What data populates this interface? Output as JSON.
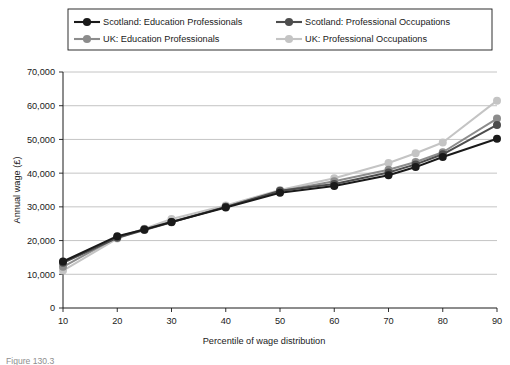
{
  "chart_data": {
    "type": "line",
    "title": "",
    "xlabel": "Percentile of wage distribution",
    "ylabel": "Annual wage (£)",
    "x": [
      10,
      20,
      25,
      30,
      40,
      50,
      60,
      70,
      75,
      80,
      90
    ],
    "xtick_labels": [
      "10",
      "20",
      "30",
      "40",
      "50",
      "60",
      "70",
      "80",
      "90"
    ],
    "xticks": [
      10,
      20,
      30,
      40,
      50,
      60,
      70,
      80,
      90
    ],
    "xlim": [
      10,
      90
    ],
    "ylim": [
      0,
      70000
    ],
    "yticks": [
      0,
      10000,
      20000,
      30000,
      40000,
      50000,
      60000,
      70000
    ],
    "ytick_labels": [
      "0",
      "10,000",
      "20,000",
      "30,000",
      "40,000",
      "50,000",
      "60,000",
      "70,000"
    ],
    "grid": "horizontal",
    "legend_position": "top",
    "series": [
      {
        "name": "Scotland: Education Professionals",
        "color": "#1a1a1a",
        "values": [
          13800,
          21300,
          23300,
          25500,
          29800,
          34200,
          36200,
          39400,
          41800,
          44800,
          50200
        ]
      },
      {
        "name": "Scotland: Professional Occupations",
        "color": "#4d4d4d",
        "values": [
          13400,
          20800,
          23100,
          25400,
          30000,
          34800,
          36800,
          40200,
          42600,
          45600,
          54300
        ]
      },
      {
        "name": "UK: Education Professionals",
        "color": "#8c8c8c",
        "values": [
          12200,
          21000,
          23400,
          25600,
          30000,
          34600,
          37600,
          41000,
          43300,
          46200,
          56200
        ]
      },
      {
        "name": "UK: Professional Occupations",
        "color": "#c4c4c4",
        "values": [
          11100,
          20600,
          23500,
          26400,
          30400,
          35000,
          38500,
          43000,
          45900,
          49100,
          61500
        ]
      }
    ]
  },
  "legend": {
    "entries": [
      {
        "label": "Scotland: Education Professionals",
        "color": "#1a1a1a"
      },
      {
        "label": "Scotland: Professional Occupations",
        "color": "#4d4d4d"
      },
      {
        "label": "UK: Education Professionals",
        "color": "#8c8c8c"
      },
      {
        "label": "UK: Professional Occupations",
        "color": "#c4c4c4"
      }
    ]
  },
  "caption": {
    "text": "Figure 130.3"
  }
}
